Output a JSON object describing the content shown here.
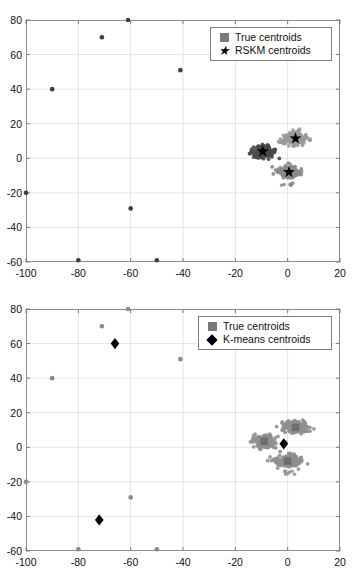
{
  "figure": {
    "panels": [
      {
        "id": "rskm",
        "legend": {
          "items": [
            {
              "label": "True centroids",
              "marker": "square-marker",
              "color": "#7a7a7a"
            },
            {
              "label": "RSKM centroids",
              "marker": "star-marker",
              "color": "#000000"
            }
          ]
        }
      },
      {
        "id": "kmeans",
        "legend": {
          "items": [
            {
              "label": "True centroids",
              "marker": "square-marker",
              "color": "#7a7a7a"
            },
            {
              "label": "K-means centroids",
              "marker": "diamond-marker",
              "color": "#000000"
            }
          ]
        }
      }
    ]
  },
  "chart_data": [
    {
      "type": "scatter",
      "title": "",
      "xlabel": "",
      "ylabel": "",
      "xlim": [
        -100,
        20
      ],
      "ylim": [
        -60,
        80
      ],
      "xticks": [
        -100,
        -80,
        -60,
        -40,
        -20,
        0,
        20
      ],
      "yticks": [
        -60,
        -40,
        -20,
        0,
        20,
        40,
        60,
        80
      ],
      "xtick_labels": [
        "-100",
        "-80",
        "-60",
        "-40",
        "-20",
        "0",
        "20"
      ],
      "ytick_labels": [
        "-60",
        "-40",
        "-20",
        "0",
        "20",
        "40",
        "60",
        "80"
      ],
      "grid": true,
      "legend_position": "top-right",
      "series": [
        {
          "name": "Cluster A (dark)",
          "type": "point-cloud",
          "color": "#4a4a4a",
          "center": [
            -9.5,
            3.5
          ],
          "spread": [
            4.2,
            3.6
          ],
          "n": 180
        },
        {
          "name": "Cluster B (light)",
          "type": "point-cloud",
          "color": "#9a9a9a",
          "center": [
            2.5,
            11.5
          ],
          "spread": [
            4.4,
            3.4
          ],
          "n": 180
        },
        {
          "name": "Cluster C (mid)",
          "type": "point-cloud",
          "color": "#8a8a8a",
          "center": [
            0.5,
            -8.0
          ],
          "spread": [
            4.0,
            3.4
          ],
          "n": 170
        },
        {
          "name": "Outliers",
          "type": "scatter",
          "color": "#3f3f3f",
          "points": [
            [
              -90,
              40
            ],
            [
              -71,
              70
            ],
            [
              -61,
              80
            ],
            [
              -41,
              51
            ],
            [
              -100,
              -20
            ],
            [
              -60,
              -29
            ],
            [
              -80,
              -59
            ],
            [
              -50,
              -59
            ]
          ]
        },
        {
          "name": "RSKM centroids",
          "type": "star",
          "color": "#000000",
          "points": [
            [
              -9.5,
              4.0
            ],
            [
              3.0,
              11.5
            ],
            [
              0.5,
              -8.0
            ]
          ]
        }
      ]
    },
    {
      "type": "scatter",
      "title": "",
      "xlabel": "",
      "ylabel": "",
      "xlim": [
        -100,
        20
      ],
      "ylim": [
        -60,
        80
      ],
      "xticks": [
        -100,
        -80,
        -60,
        -40,
        -20,
        0,
        20
      ],
      "yticks": [
        -60,
        -40,
        -20,
        0,
        20,
        40,
        60,
        80
      ],
      "xtick_labels": [
        "-100",
        "-80",
        "-60",
        "-40",
        "-20",
        "0",
        "20"
      ],
      "ytick_labels": [
        "-60",
        "-40",
        "-20",
        "0",
        "20",
        "40",
        "60",
        "80"
      ],
      "grid": true,
      "legend_position": "top-right",
      "series": [
        {
          "name": "Cluster A",
          "type": "point-cloud",
          "color": "#8f8f8f",
          "center": [
            -9.0,
            3.5
          ],
          "spread": [
            4.2,
            3.6
          ],
          "n": 180
        },
        {
          "name": "Cluster B",
          "type": "point-cloud",
          "color": "#8f8f8f",
          "center": [
            3.0,
            11.5
          ],
          "spread": [
            4.6,
            3.4
          ],
          "n": 180
        },
        {
          "name": "Cluster C",
          "type": "point-cloud",
          "color": "#8f8f8f",
          "center": [
            0.0,
            -8.0
          ],
          "spread": [
            4.2,
            3.6
          ],
          "n": 175
        },
        {
          "name": "Outliers",
          "type": "scatter",
          "color": "#8a8a8a",
          "points": [
            [
              -90,
              40
            ],
            [
              -71,
              70
            ],
            [
              -61,
              80
            ],
            [
              -41,
              51
            ],
            [
              -100,
              -20
            ],
            [
              -60,
              -29
            ],
            [
              -80,
              -59
            ],
            [
              -50,
              -59
            ]
          ]
        },
        {
          "name": "True centroids",
          "type": "square",
          "color": "#6e6e6e",
          "points": [
            [
              -9.0,
              3.5
            ],
            [
              3.0,
              11.5
            ],
            [
              0.0,
              -8.0
            ]
          ]
        },
        {
          "name": "K-means centroids",
          "type": "diamond",
          "color": "#000000",
          "points": [
            [
              -66,
              60
            ],
            [
              -72,
              -42
            ],
            [
              -1.5,
              2.0
            ]
          ]
        }
      ]
    }
  ]
}
